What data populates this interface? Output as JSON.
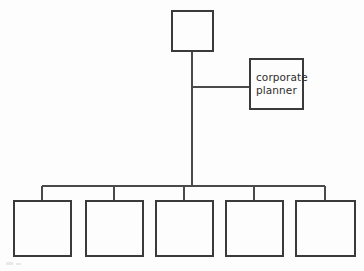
{
  "diagram": {
    "type": "organizational-chart",
    "background_color": "#fdfdfd",
    "line_color": "#4a4a4a",
    "box_border_color": "#3a3a3a",
    "text_color": "#2e2e2e",
    "nodes": [
      {
        "id": "top",
        "name": "top-node",
        "label": "",
        "role": "root",
        "x": 171,
        "y": 10,
        "width": 43,
        "height": 42
      },
      {
        "id": "staff",
        "name": "staff-node-corporate-planner",
        "label": "corporate\nplanner",
        "role": "staff",
        "x": 249,
        "y": 58,
        "width": 55,
        "height": 52
      },
      {
        "id": "sub1",
        "name": "subordinate-node-1",
        "label": "",
        "role": "subordinate",
        "x": 13,
        "y": 200,
        "width": 59,
        "height": 57
      },
      {
        "id": "sub2",
        "name": "subordinate-node-2",
        "label": "",
        "role": "subordinate",
        "x": 85,
        "y": 200,
        "width": 59,
        "height": 57
      },
      {
        "id": "sub3",
        "name": "subordinate-node-3",
        "label": "",
        "role": "subordinate",
        "x": 155,
        "y": 200,
        "width": 59,
        "height": 57
      },
      {
        "id": "sub4",
        "name": "subordinate-node-4",
        "label": "",
        "role": "subordinate",
        "x": 225,
        "y": 200,
        "width": 59,
        "height": 57
      },
      {
        "id": "sub5",
        "name": "subordinate-node-5",
        "label": "",
        "role": "subordinate",
        "x": 295,
        "y": 200,
        "width": 61,
        "height": 57
      }
    ],
    "connectors": [
      {
        "name": "trunk-vertical",
        "orientation": "vertical",
        "x": 192,
        "y": 52,
        "length": 134
      },
      {
        "name": "staff-branch-horizontal",
        "orientation": "horizontal",
        "x": 192,
        "y": 87,
        "length": 57
      },
      {
        "name": "distribution-bus-horizontal",
        "orientation": "horizontal",
        "x": 42,
        "y": 186,
        "length": 283
      },
      {
        "name": "drop-to-subordinate-1",
        "orientation": "vertical",
        "x": 42,
        "y": 186,
        "length": 14
      },
      {
        "name": "drop-to-subordinate-2",
        "orientation": "vertical",
        "x": 114,
        "y": 186,
        "length": 14
      },
      {
        "name": "drop-to-subordinate-3",
        "orientation": "vertical",
        "x": 184,
        "y": 186,
        "length": 14
      },
      {
        "name": "drop-to-subordinate-4",
        "orientation": "vertical",
        "x": 254,
        "y": 186,
        "length": 14
      },
      {
        "name": "drop-to-subordinate-5",
        "orientation": "vertical",
        "x": 325,
        "y": 186,
        "length": 14
      }
    ]
  }
}
